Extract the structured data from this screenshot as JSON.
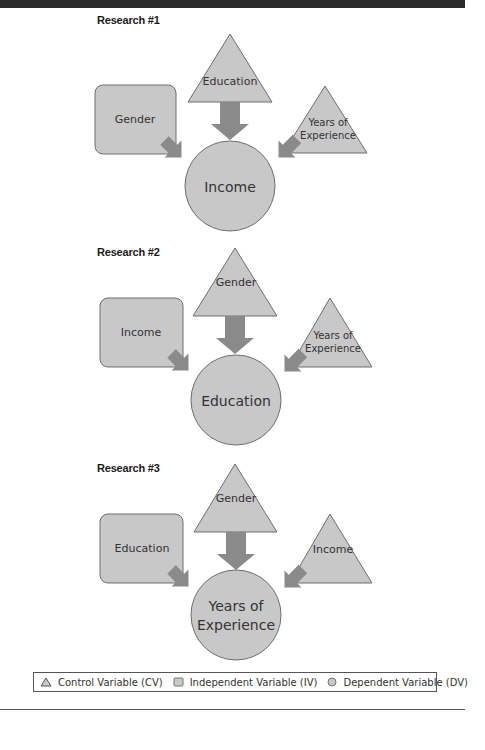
{
  "colors": {
    "shape_fill": "#c8c8c8",
    "shape_stroke": "#6e6e6e",
    "arrow_fill": "#8a8a8a",
    "text": "#333333"
  },
  "panels": [
    {
      "title": "Research #1",
      "independent": "Gender",
      "control_top": "Education",
      "control_right": [
        "Years of",
        "Experience"
      ],
      "dependent": [
        "Income"
      ]
    },
    {
      "title": "Research #2",
      "independent": "Income",
      "control_top": "Gender",
      "control_right": [
        "Years of",
        "Experience"
      ],
      "dependent": [
        "Education"
      ]
    },
    {
      "title": "Research #3",
      "independent": "Education",
      "control_top": "Gender",
      "control_right": [
        "Income"
      ],
      "dependent": [
        "Years of",
        "Experience"
      ]
    }
  ],
  "legend": {
    "items": [
      {
        "icon": "triangle-icon",
        "label": "Control Variable (CV)"
      },
      {
        "icon": "square-icon",
        "label": "Independent Variable (IV)"
      },
      {
        "icon": "circle-icon",
        "label": "Dependent Variable (DV)"
      }
    ]
  }
}
